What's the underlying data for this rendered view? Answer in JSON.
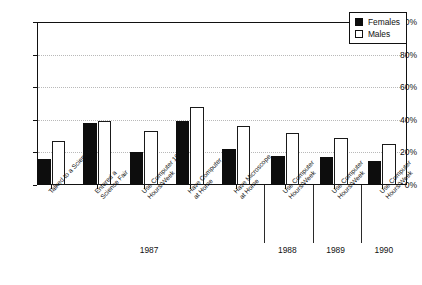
{
  "chart_data": {
    "type": "bar",
    "title": "",
    "subtitle": "",
    "xlabel": "",
    "ylabel": "",
    "ylim": [
      0,
      100
    ],
    "yticks": [
      "0%",
      "20%",
      "40%",
      "60%",
      "80%",
      "100%"
    ],
    "ytick_values": [
      0,
      20,
      40,
      60,
      80,
      100
    ],
    "grid": "horizontal-dotted",
    "legend_position": "top-right",
    "orientation": "vertical",
    "categories": [
      "Talked to a Scientist",
      "Entered a Science Fair",
      "Use Computer 10+ Hours/Week",
      "Have Computer at Home",
      "Have Microscope at Home",
      "Use Computer 10+ Hours/Week",
      "Use Computer 10+ Hours/Week",
      "Use Computer 10+ Hours/Week"
    ],
    "category_labels_wrapped": [
      "Talked to a Scientist",
      "Entered a\nScience Fair",
      "Use Computer 10+\nHours/Week",
      "Have Computer\nat Home",
      "Have Microscope\nat Home",
      "Use Computer\nHours/Week",
      "Use Computer\nHours/Week",
      "Use Computer\nHours/Week"
    ],
    "groups": [
      {
        "label": "1987",
        "category_indices": [
          0,
          1,
          2,
          3,
          4
        ]
      },
      {
        "label": "1988",
        "category_indices": [
          5
        ]
      },
      {
        "label": "1989",
        "category_indices": [
          6
        ]
      },
      {
        "label": "1990",
        "category_indices": [
          7
        ]
      }
    ],
    "series": [
      {
        "name": "Females",
        "color": "#0d0d0d",
        "style": "filled",
        "values": [
          16,
          38,
          20,
          39,
          22,
          18,
          17,
          15
        ]
      },
      {
        "name": "Males",
        "color": "#ffffff",
        "style": "outlined",
        "values": [
          27,
          39,
          33,
          48,
          36,
          32,
          29,
          25
        ]
      }
    ]
  },
  "legend": {
    "items": [
      {
        "label": "Females",
        "swatch": "filled-square"
      },
      {
        "label": "Males",
        "swatch": "open-square"
      }
    ]
  }
}
